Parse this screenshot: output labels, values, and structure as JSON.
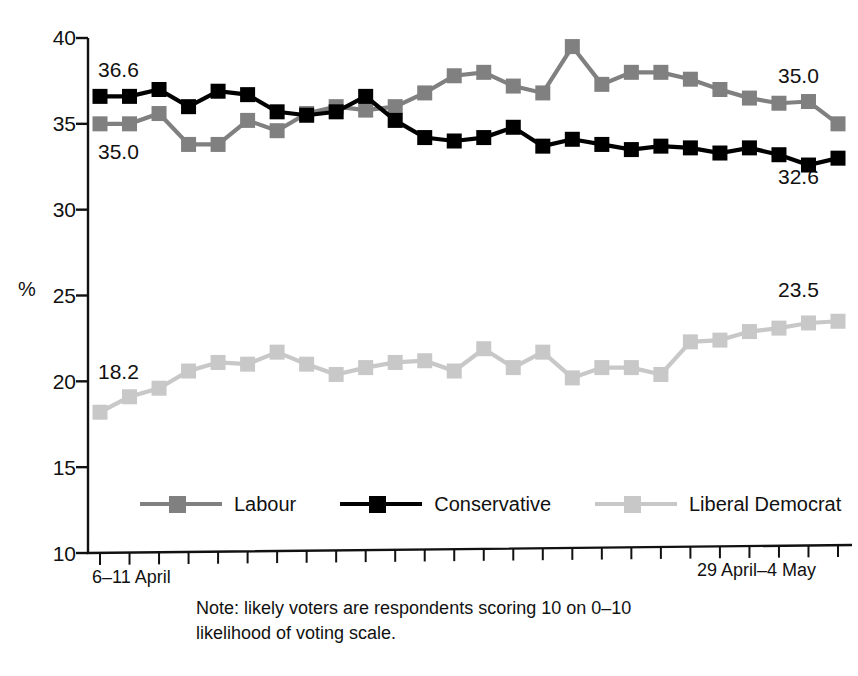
{
  "chart_data": {
    "type": "line",
    "title": "",
    "xlabel": "",
    "ylabel": "%",
    "ylim": [
      10,
      40
    ],
    "yticks": [
      10,
      15,
      20,
      25,
      30,
      35,
      40
    ],
    "ytick_labels": [
      "10",
      "15",
      "20",
      "25",
      "30",
      "35",
      "40"
    ],
    "grid": false,
    "legend_position": "bottom",
    "n_points": 26,
    "x_tick_count": 26,
    "x_first_label": "6–11 April",
    "x_last_label": "29 April–4 May",
    "categories": [
      "6–11 April",
      "p2",
      "p3",
      "p4",
      "p5",
      "p6",
      "p7",
      "p8",
      "p9",
      "p10",
      "p11",
      "p12",
      "p13",
      "p14",
      "p15",
      "p16",
      "p17",
      "p18",
      "p19",
      "p20",
      "p21",
      "p22",
      "p23",
      "p24",
      "p25",
      "29 April–4 May"
    ],
    "series": [
      {
        "name": "Labour",
        "color": "#808080",
        "values": [
          35.0,
          35.0,
          35.6,
          33.8,
          33.8,
          35.2,
          34.6,
          35.6,
          36.0,
          35.8,
          36.0,
          36.8,
          37.8,
          38.0,
          37.2,
          36.8,
          39.5,
          37.3,
          38.0,
          38.0,
          37.6,
          37.0,
          36.5,
          36.2,
          36.3,
          35.0
        ],
        "start_label": "35.0",
        "end_label": "35.0"
      },
      {
        "name": "Conservative",
        "color": "#000000",
        "values": [
          36.6,
          36.6,
          37.0,
          36.0,
          36.9,
          36.7,
          35.7,
          35.5,
          35.7,
          36.6,
          35.2,
          34.2,
          34.0,
          34.2,
          34.8,
          33.7,
          34.1,
          33.8,
          33.5,
          33.7,
          33.6,
          33.3,
          33.6,
          33.2,
          32.6,
          33.0
        ],
        "start_label": "36.6",
        "end_label": "32.6"
      },
      {
        "name": "Liberal Democrat",
        "color": "#c8c8c8",
        "values": [
          18.2,
          19.1,
          19.6,
          20.6,
          21.1,
          21.0,
          21.7,
          21.0,
          20.4,
          20.8,
          21.1,
          21.2,
          20.6,
          21.9,
          20.8,
          21.7,
          20.2,
          20.8,
          20.8,
          20.4,
          22.3,
          22.4,
          22.9,
          23.1,
          23.4,
          23.5
        ],
        "start_label": "18.2",
        "end_label": "23.5"
      }
    ],
    "annotations": [
      {
        "name": "conservative-start",
        "text": "36.6",
        "value": 36.6
      },
      {
        "name": "labour-start",
        "text": "35.0",
        "value": 35.0
      },
      {
        "name": "labour-end",
        "text": "35.0",
        "value": 35.0
      },
      {
        "name": "conservative-end",
        "text": "32.6",
        "value": 32.6
      },
      {
        "name": "libdem-start",
        "text": "18.2",
        "value": 18.2
      },
      {
        "name": "libdem-end",
        "text": "23.5",
        "value": 23.5
      }
    ]
  },
  "axis": {
    "y_label": "%",
    "ticks": [
      "40",
      "35",
      "30",
      "25",
      "20",
      "15",
      "10"
    ],
    "x_start": "6–11 April",
    "x_end": "29 April–4 May"
  },
  "legend": {
    "items": [
      {
        "label": "Labour",
        "color": "#808080"
      },
      {
        "label": "Conservative",
        "color": "#000000"
      },
      {
        "label": "Liberal Democrat",
        "color": "#c8c8c8"
      }
    ]
  },
  "note": {
    "text": "Note: likely voters are respondents scoring 10 on 0–10\nlikelihood of voting scale."
  }
}
